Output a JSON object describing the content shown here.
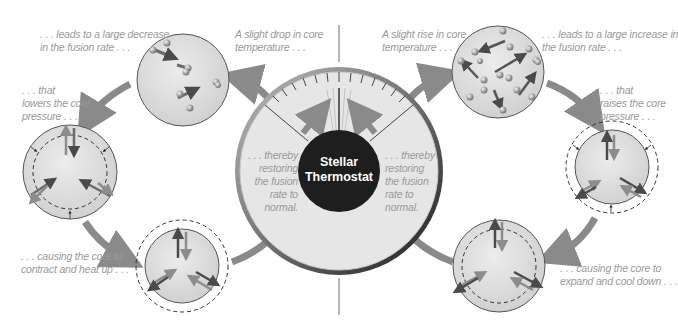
{
  "diagram": {
    "title_line1": "Stellar",
    "title_line2": "Thermostat",
    "left_cycle": {
      "step1": {
        "line1": "A slight drop in core",
        "line2": "temperature . . ."
      },
      "step2": {
        "line1": ". . . leads to a large decrease",
        "line2": "in the fusion rate . . ."
      },
      "step3": {
        "line1": ". . . that",
        "line2": "lowers the core",
        "line3": "pressure . . ."
      },
      "step4": {
        "line1": ". . . causing the core to",
        "line2": "contract and heat up . . ."
      },
      "step5": {
        "line1": ". . . thereby",
        "line2": "restoring",
        "line3": "the fusion",
        "line4": "rate to",
        "line5": "normal."
      }
    },
    "right_cycle": {
      "step1": {
        "line1": "A slight rise in core",
        "line2": "temperature . . ."
      },
      "step2": {
        "line1": ". . . leads to a large increase in",
        "line2": "the fusion rate . . ."
      },
      "step3": {
        "line1": ". . . that",
        "line2": "raises the core",
        "line3": "pressure . . ."
      },
      "step4": {
        "line1": ". . . causing the core to",
        "line2": "expand and cool down . . ."
      },
      "step5": {
        "line1": ". . . thereby",
        "line2": "restoring",
        "line3": "the fusion",
        "line4": "rate to",
        "line5": "normal."
      }
    },
    "colors": {
      "circle_fill": "#dcdcdc",
      "circle_stroke": "#555555",
      "arrow": "#8a8a8a",
      "dark_arrow": "#4a4a4a",
      "center_disc": "#1e1e1e",
      "text": "#9a9a9a"
    }
  }
}
